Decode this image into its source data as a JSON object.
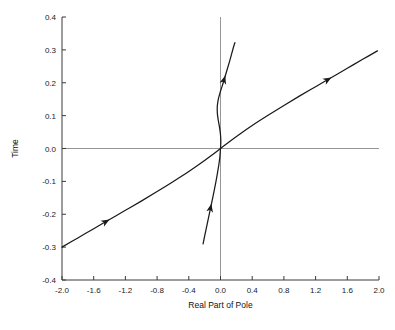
{
  "chart_data": {
    "type": "line",
    "title": "",
    "xlabel": "Real Part of Pole",
    "ylabel": "Time",
    "xlim": [
      -2.0,
      2.0
    ],
    "ylim": [
      -0.4,
      0.4
    ],
    "grid": false,
    "legend": null,
    "xticks": [
      "-2.0",
      "-1.6",
      "-1.2",
      "-0.8",
      "-0.4",
      "0.0",
      "0.4",
      "0.8",
      "1.2",
      "1.6",
      "2.0"
    ],
    "xtick_values": [
      -2.0,
      -1.6,
      -1.2,
      -0.8,
      -0.4,
      0.0,
      0.4,
      0.8,
      1.2,
      1.6,
      2.0
    ],
    "yticks": [
      "0.4",
      "0.3",
      "0.2",
      "0.1",
      "0.0",
      "-0.1",
      "-0.2",
      "-0.3",
      "-0.4"
    ],
    "ytick_values": [
      0.4,
      0.3,
      0.2,
      0.1,
      0.0,
      -0.1,
      -0.2,
      -0.3,
      -0.4
    ],
    "zero_lines": {
      "x": 0.0,
      "y": 0.0
    },
    "series": [
      {
        "name": "real-pole-branch",
        "comment": "Broad S-shaped root-locus branch from lower-left to upper-right, nearly straight",
        "points": [
          [
            -2.0,
            -0.3
          ],
          [
            -1.8,
            -0.272
          ],
          [
            -1.6,
            -0.244
          ],
          [
            -1.4,
            -0.216
          ],
          [
            -1.2,
            -0.188
          ],
          [
            -1.0,
            -0.16
          ],
          [
            -0.8,
            -0.131
          ],
          [
            -0.6,
            -0.101
          ],
          [
            -0.4,
            -0.07
          ],
          [
            -0.25,
            -0.045
          ],
          [
            -0.12,
            -0.022
          ],
          [
            0.0,
            0.0
          ],
          [
            0.12,
            0.022
          ],
          [
            0.25,
            0.045
          ],
          [
            0.4,
            0.07
          ],
          [
            0.6,
            0.101
          ],
          [
            0.8,
            0.131
          ],
          [
            1.0,
            0.16
          ],
          [
            1.2,
            0.188
          ],
          [
            1.4,
            0.216
          ],
          [
            1.6,
            0.244
          ],
          [
            1.8,
            0.272
          ],
          [
            1.98,
            0.297
          ]
        ],
        "arrows": [
          {
            "at": [
              -1.4,
              -0.216
            ],
            "direction": "up-right"
          },
          {
            "at": [
              1.4,
              0.216
            ],
            "direction": "up-right"
          }
        ]
      },
      {
        "name": "complex-pole-branch",
        "comment": "Steep S-curve with near-vertical inflection through the origin",
        "points": [
          [
            -0.22,
            -0.29
          ],
          [
            -0.19,
            -0.255
          ],
          [
            -0.155,
            -0.215
          ],
          [
            -0.12,
            -0.175
          ],
          [
            -0.088,
            -0.138
          ],
          [
            -0.06,
            -0.104
          ],
          [
            -0.038,
            -0.074
          ],
          [
            -0.02,
            -0.048
          ],
          [
            -0.008,
            -0.025
          ],
          [
            0.0,
            0.0
          ],
          [
            0.004,
            0.02
          ],
          [
            0.0,
            0.042
          ],
          [
            -0.012,
            0.064
          ],
          [
            -0.028,
            0.086
          ],
          [
            -0.04,
            0.108
          ],
          [
            -0.04,
            0.13
          ],
          [
            -0.026,
            0.152
          ],
          [
            0.0,
            0.174
          ],
          [
            0.034,
            0.2
          ],
          [
            0.074,
            0.232
          ],
          [
            0.118,
            0.268
          ],
          [
            0.16,
            0.305
          ],
          [
            0.182,
            0.322
          ]
        ],
        "arrows": [
          {
            "at": [
              -0.115,
              -0.168
            ],
            "direction": "up-right"
          },
          {
            "at": [
              0.06,
              0.222
            ],
            "direction": "up-right"
          }
        ]
      }
    ]
  }
}
